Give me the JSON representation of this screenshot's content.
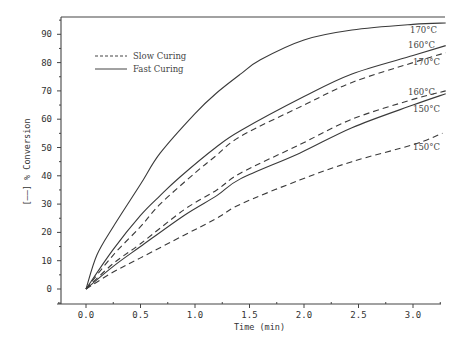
{
  "chart_data": {
    "type": "line",
    "title": "",
    "xlabel": "Time (min)",
    "ylabel": "[——] % Conversion",
    "xlim": [
      -0.26,
      3.3
    ],
    "ylim": [
      -5,
      95
    ],
    "grid": false,
    "legend_position": "upper-left",
    "x_ticks": [
      "0.0",
      "0.5",
      "1.0",
      "1.5",
      "2.0",
      "2.5",
      "3.0"
    ],
    "y_ticks": [
      "0",
      "10",
      "20",
      "30",
      "40",
      "50",
      "60",
      "70",
      "80",
      "90"
    ],
    "legend": [
      {
        "label": "Slow Curing",
        "style": "dashed"
      },
      {
        "label": "Fast Curing",
        "style": "solid"
      }
    ],
    "series": [
      {
        "name": "Fast Curing 170°C",
        "style": "solid",
        "label": "170°C",
        "x": [
          0,
          0.1,
          0.25,
          0.5,
          0.68,
          1.0,
          1.19,
          1.42,
          1.6,
          2.0,
          2.44,
          3.0,
          3.3
        ],
        "y": [
          0,
          12,
          22,
          37,
          48,
          62,
          69,
          76,
          81,
          88,
          91.5,
          93.5,
          94
        ]
      },
      {
        "name": "Fast Curing 160°C",
        "style": "solid",
        "label": "160°C",
        "x": [
          0,
          0.25,
          0.5,
          0.68,
          0.86,
          1.19,
          1.42,
          2.0,
          2.44,
          3.0,
          3.3
        ],
        "y": [
          0,
          14,
          26,
          33,
          39.5,
          50,
          56,
          68,
          76,
          82.5,
          86
        ]
      },
      {
        "name": "Slow Curing 170°C",
        "style": "dashed",
        "label": "170°C",
        "x": [
          0,
          0.25,
          0.5,
          0.68,
          1.0,
          1.19,
          1.42,
          2.0,
          2.44,
          3.0,
          3.3
        ],
        "y": [
          0,
          12,
          22,
          30,
          41,
          47,
          54,
          65,
          73,
          80,
          83.5
        ]
      },
      {
        "name": "Slow Curing 160°C",
        "style": "dashed",
        "label": "160°C",
        "x": [
          0,
          0.25,
          0.5,
          0.9,
          1.2,
          1.42,
          1.96,
          2.44,
          3.0,
          3.3
        ],
        "y": [
          0,
          9,
          16,
          28,
          35,
          41,
          51,
          60,
          67,
          70
        ]
      },
      {
        "name": "Fast Curing 150°C",
        "style": "solid",
        "label": "150°C",
        "x": [
          0,
          0.25,
          0.5,
          0.9,
          1.2,
          1.42,
          1.96,
          2.44,
          3.0,
          3.3
        ],
        "y": [
          0,
          8,
          15,
          26,
          33,
          39,
          48,
          57,
          65,
          69
        ]
      },
      {
        "name": "Slow Curing 150°C",
        "style": "dashed",
        "label": "150°C",
        "x": [
          0,
          0.25,
          0.5,
          0.9,
          1.2,
          1.42,
          1.96,
          2.44,
          3.0,
          3.27
        ],
        "y": [
          0,
          6,
          11,
          19,
          25,
          30,
          38.5,
          45,
          51,
          55
        ]
      }
    ],
    "annotations": [
      {
        "text": "170°C",
        "series": "Fast Curing 170°C"
      },
      {
        "text": "160°C",
        "series": "Fast Curing 160°C"
      },
      {
        "text": "170°C",
        "series": "Slow Curing 170°C"
      },
      {
        "text": "160°C",
        "series": "Slow Curing 160°C"
      },
      {
        "text": "150°C",
        "series": "Fast Curing 150°C"
      },
      {
        "text": "150°C",
        "series": "Slow Curing 150°C"
      }
    ]
  }
}
